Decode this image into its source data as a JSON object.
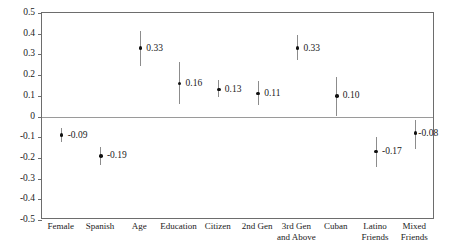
{
  "chart_data": {
    "type": "scatter",
    "title": "",
    "subtitle": "",
    "xlabel": "",
    "ylabel": "",
    "ylim": [
      -0.5,
      0.5
    ],
    "ytick_labels": [
      "0.5",
      "0.4",
      "0.3",
      "0.2",
      "0.1",
      "0",
      "-0.1",
      "-0.2",
      "-0.3",
      "-0.4",
      "-0.5"
    ],
    "ytick_values": [
      0.5,
      0.4,
      0.3,
      0.2,
      0.1,
      0,
      -0.1,
      -0.2,
      -0.3,
      -0.4,
      -0.5
    ],
    "grid": false,
    "legend": "none",
    "zero_reference_line": 0,
    "error_bars": "confidence interval",
    "marker_color": "#111111",
    "whisker_color": "#8c8c8c",
    "frame_color": "#6d6d6d",
    "categories": [
      "Female",
      "Spanish",
      "Age",
      "Education",
      "Citizen",
      "2nd Gen",
      "3rd Gen\nand Above",
      "Cuban",
      "Latino\nFriends",
      "Mixed\nFriends"
    ],
    "values": [
      -0.09,
      -0.19,
      0.33,
      0.16,
      0.13,
      0.11,
      0.33,
      0.1,
      -0.17,
      -0.08
    ],
    "value_labels": [
      "-0.09",
      "-0.19",
      "0.33",
      "0.16",
      "0.13",
      "0.11",
      "0.33",
      "0.10",
      "-0.17",
      "-0.08"
    ],
    "ci_low": [
      -0.125,
      -0.235,
      0.245,
      0.062,
      0.095,
      0.055,
      0.275,
      0.0,
      -0.245,
      -0.155
    ],
    "ci_high": [
      -0.055,
      -0.145,
      0.415,
      0.262,
      0.175,
      0.17,
      0.395,
      0.19,
      -0.1,
      -0.015
    ],
    "points": [
      {
        "category": "Female",
        "value": -0.09,
        "label": "-0.09",
        "ci_low": -0.125,
        "ci_high": -0.055
      },
      {
        "category": "Spanish",
        "value": -0.19,
        "label": "-0.19",
        "ci_low": -0.235,
        "ci_high": -0.145
      },
      {
        "category": "Age",
        "value": 0.33,
        "label": "0.33",
        "ci_low": 0.245,
        "ci_high": 0.415
      },
      {
        "category": "Education",
        "value": 0.16,
        "label": "0.16",
        "ci_low": 0.062,
        "ci_high": 0.262
      },
      {
        "category": "Citizen",
        "value": 0.13,
        "label": "0.13",
        "ci_low": 0.095,
        "ci_high": 0.175
      },
      {
        "category": "2nd Gen",
        "value": 0.11,
        "label": "0.11",
        "ci_low": 0.055,
        "ci_high": 0.17
      },
      {
        "category": "3rd Gen and Above",
        "value": 0.33,
        "label": "0.33",
        "ci_low": 0.275,
        "ci_high": 0.395
      },
      {
        "category": "Cuban",
        "value": 0.1,
        "label": "0.10",
        "ci_low": 0.0,
        "ci_high": 0.19
      },
      {
        "category": "Latino Friends",
        "value": -0.17,
        "label": "-0.17",
        "ci_low": -0.245,
        "ci_high": -0.1
      },
      {
        "category": "Mixed Friends",
        "value": -0.08,
        "label": "-0.08",
        "ci_low": -0.155,
        "ci_high": -0.015
      }
    ]
  }
}
